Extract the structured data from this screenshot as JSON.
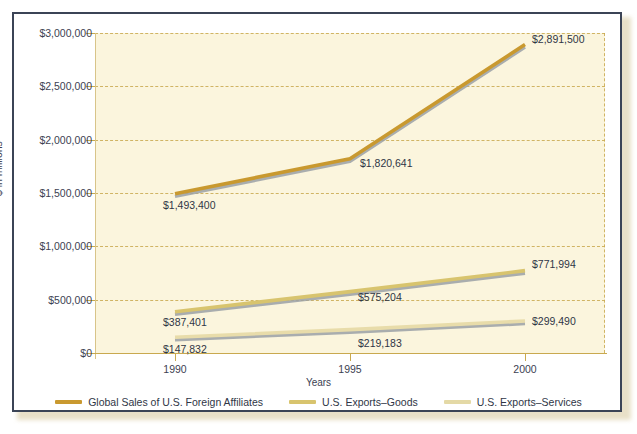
{
  "chart_data": {
    "type": "line",
    "title": "",
    "xlabel": "Years",
    "ylabel": "$ in millions",
    "categories": [
      "1990",
      "1995",
      "2000"
    ],
    "x": [
      1990,
      1995,
      2000
    ],
    "xlim": [
      1990,
      2000
    ],
    "ylim": [
      0,
      3000000
    ],
    "grid": true,
    "legend_position": "bottom",
    "ytick_labels": [
      "$3,000,000",
      "$2,500,000",
      "$2,000,000",
      "$1,500,000",
      "$1,000,000",
      "$500,000",
      "$0"
    ],
    "ytick_values": [
      3000000,
      2500000,
      2000000,
      1500000,
      1000000,
      500000,
      0
    ],
    "series": [
      {
        "name": "Global Sales of U.S. Foreign Affiliates",
        "color": "#c9992f",
        "values": [
          1493400,
          1820641,
          2891500
        ],
        "labels": [
          "$1,493,400",
          "$1,820,641",
          "$2,891,500"
        ]
      },
      {
        "name": "U.S. Exports–Goods",
        "color": "#d8c46e",
        "values": [
          387401,
          575204,
          771994
        ],
        "labels": [
          "$387,401",
          "$575,204",
          "$771,994"
        ]
      },
      {
        "name": "U.S. Exports–Services",
        "color": "#e8dcaa",
        "values": [
          147832,
          219183,
          299490
        ],
        "labels": [
          "$147,832",
          "$219,183",
          "$299,490"
        ]
      }
    ]
  },
  "axes": {
    "y_title": "$ in millions",
    "x_title": "Years",
    "y_ticks": [
      {
        "label": "$3,000,000"
      },
      {
        "label": "$2,500,000"
      },
      {
        "label": "$2,000,000"
      },
      {
        "label": "$1,500,000"
      },
      {
        "label": "$1,000,000"
      },
      {
        "label": "$500,000"
      },
      {
        "label": "$0"
      }
    ],
    "x_ticks": [
      {
        "label": "1990"
      },
      {
        "label": "1995"
      },
      {
        "label": "2000"
      }
    ]
  },
  "legend": {
    "items": [
      {
        "label": "Global Sales of U.S. Foreign Affiliates",
        "color": "#c9992f"
      },
      {
        "label": "U.S. Exports–Goods",
        "color": "#d8c46e"
      },
      {
        "label": "U.S. Exports–Services",
        "color": "#e4d9a6"
      }
    ]
  },
  "data_labels": [
    {
      "text": "$2,891,500"
    },
    {
      "text": "$1,820,641"
    },
    {
      "text": "$1,493,400"
    },
    {
      "text": "$771,994"
    },
    {
      "text": "$575,204"
    },
    {
      "text": "$387,401"
    },
    {
      "text": "$299,490"
    },
    {
      "text": "$219,183"
    },
    {
      "text": "$147,832"
    }
  ],
  "colors": {
    "frame": "#3b4456",
    "plot_background": "#fbf5dd",
    "grid": "#c9a94f",
    "text": "#2f3646"
  }
}
